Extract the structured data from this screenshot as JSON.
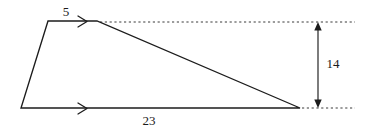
{
  "figure": {
    "type": "geometry-diagram",
    "shape_name": "trapezoid",
    "background_color": "#ffffff",
    "stroke_color": "#1c1c1c",
    "dotted_color": "#3a3a3a",
    "labels": {
      "top_side_length": "5",
      "bottom_side_length": "23",
      "height": "14"
    },
    "vertices": {
      "top_left": [
        48,
        21
      ],
      "top_right": [
        97,
        21
      ],
      "bottom_right": [
        300,
        108
      ],
      "bottom_left": [
        21,
        108
      ]
    },
    "parallel_marks": {
      "top_edge_chevron": "single-chevron-right",
      "bottom_edge_chevron": "single-chevron-right"
    },
    "dimension": {
      "orientation": "vertical",
      "x": 318,
      "y_top": 22,
      "y_bottom": 108,
      "arrow_style": "double-headed"
    },
    "extension_lines": {
      "upper": {
        "y": 22,
        "x_start": 100,
        "x_end": 355
      },
      "lower": {
        "y": 108,
        "x_start": 302,
        "x_end": 355
      }
    }
  }
}
